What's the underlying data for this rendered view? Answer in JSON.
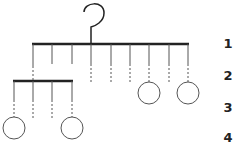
{
  "diagram": {
    "type": "mobile-hierarchy",
    "colors": {
      "stroke": "#222222",
      "thin": "#555555",
      "background": "#ffffff"
    },
    "levels": [
      {
        "label": "1",
        "y": 44
      },
      {
        "label": "2",
        "y": 76
      },
      {
        "label": "3",
        "y": 108
      },
      {
        "label": "4",
        "y": 138
      }
    ],
    "hook": {
      "x": 91,
      "top": 3,
      "bottom": 44
    },
    "top_bar": {
      "x1": 32,
      "x2": 189,
      "y": 44
    },
    "top_hangers": [
      {
        "x": 33,
        "solid_end": 66,
        "dashed_end": 81
      },
      {
        "x": 52,
        "solid_end": 64,
        "dashed_end": null
      },
      {
        "x": 72,
        "solid_end": 64,
        "dashed_end": null
      },
      {
        "x": 91,
        "solid_end": 64,
        "dashed_end": 82
      },
      {
        "x": 111,
        "solid_end": 64,
        "dashed_end": 82
      },
      {
        "x": 130,
        "solid_end": 64,
        "dashed_end": 82
      },
      {
        "x": 149,
        "solid_end": 64,
        "dashed_end": 82
      },
      {
        "x": 169,
        "solid_end": 64,
        "dashed_end": 82
      },
      {
        "x": 188,
        "solid_end": 64,
        "dashed_end": 82
      }
    ],
    "sub_bar": {
      "x1": 13,
      "x2": 73,
      "y": 81
    },
    "sub_hangers": [
      {
        "x": 14,
        "solid_end": 100,
        "dashed_end": 117
      },
      {
        "x": 33,
        "solid_end": 100,
        "dashed_end": 118
      },
      {
        "x": 52,
        "solid_end": 100,
        "dashed_end": 118
      },
      {
        "x": 72,
        "solid_end": 100,
        "dashed_end": 117
      }
    ],
    "circles": [
      {
        "cx": 149,
        "cy": 93,
        "r": 11
      },
      {
        "cx": 188,
        "cy": 93,
        "r": 11
      },
      {
        "cx": 14,
        "cy": 128,
        "r": 11
      },
      {
        "cx": 72,
        "cy": 128,
        "r": 11
      }
    ]
  }
}
